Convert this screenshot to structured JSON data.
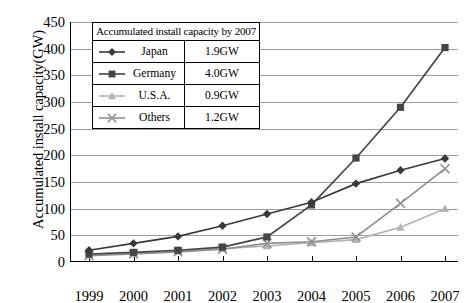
{
  "chart_data": {
    "type": "line",
    "title": "",
    "xlabel": "",
    "ylabel": "Accumulated install capacity(GW)",
    "categories": [
      "1999",
      "2000",
      "2001",
      "2002",
      "2003",
      "2004",
      "2005",
      "2006",
      "2007"
    ],
    "ylim": [
      0,
      450
    ],
    "yticks": [
      0,
      50,
      100,
      150,
      200,
      250,
      300,
      350,
      400,
      450
    ],
    "grid": true,
    "legend_position": "upper-left-inside",
    "series": [
      {
        "name": "Japan",
        "marker": "diamond",
        "color": "#3a3a3a",
        "values": [
          22,
          35,
          48,
          68,
          90,
          112,
          147,
          172,
          194
        ]
      },
      {
        "name": "Germany",
        "marker": "square",
        "color": "#454545",
        "values": [
          15,
          18,
          22,
          28,
          47,
          107,
          195,
          290,
          402
        ]
      },
      {
        "name": "U.S.A.",
        "marker": "triangle",
        "color": "#b3b3b3",
        "values": [
          13,
          16,
          20,
          25,
          30,
          36,
          42,
          65,
          100
        ]
      },
      {
        "name": "Others",
        "marker": "cross-star",
        "color": "#8f8f8f",
        "values": [
          12,
          15,
          19,
          24,
          35,
          38,
          47,
          110,
          175
        ]
      }
    ]
  },
  "legend": {
    "title": "Accumulated install capacity by 2007",
    "rows": [
      {
        "name": "Japan",
        "value": "1.9GW"
      },
      {
        "name": "Germany",
        "value": "4.0GW"
      },
      {
        "name": "U.S.A.",
        "value": "0.9GW"
      },
      {
        "name": "Others",
        "value": "1.2GW"
      }
    ]
  },
  "axis": {
    "y_title": "Accumulated install capacity(GW)",
    "y_tick_labels": [
      "450",
      "400",
      "350",
      "300",
      "250",
      "200",
      "150",
      "100",
      "50",
      "0"
    ],
    "x_tick_labels": [
      "1999",
      "2000",
      "2001",
      "2002",
      "2003",
      "2004",
      "2005",
      "2006",
      "2007"
    ]
  },
  "colors": {
    "japan": "#3a3a3a",
    "germany": "#454545",
    "usa": "#b3b3b3",
    "others": "#8f8f8f",
    "grid": "#9d9d9d",
    "axis": "#000000"
  }
}
